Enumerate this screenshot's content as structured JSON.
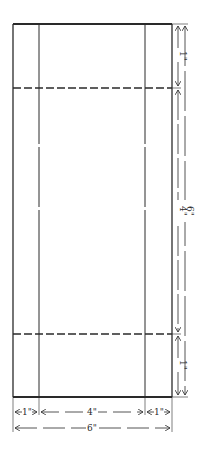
{
  "diagram": {
    "type": "dimensioned-drawing",
    "stroke_color": "#2a2a2a",
    "background": "#ffffff",
    "outline": {
      "left": 13,
      "right": 172,
      "top": 24,
      "bottom": 397
    },
    "vertical_fold_lines": [
      39,
      145
    ],
    "horizontal_dashed_lines": [
      88,
      334
    ],
    "right_dimensions": {
      "segments": [
        {
          "label": "1\"",
          "from": 24,
          "to": 88
        },
        {
          "label": "4\"",
          "from": 88,
          "to": 334
        },
        {
          "label": "1\"",
          "from": 334,
          "to": 397
        }
      ],
      "total": {
        "label": "6\"",
        "from": 24,
        "to": 397
      }
    },
    "bottom_dimensions": {
      "segments": [
        {
          "label": "1\"",
          "from": 13,
          "to": 39
        },
        {
          "label": "4\"",
          "from": 39,
          "to": 145
        },
        {
          "label": "1\"",
          "from": 145,
          "to": 172
        }
      ],
      "total": {
        "label": "6\"",
        "from": 13,
        "to": 172
      }
    }
  },
  "labels": {
    "right_top": "1\"",
    "right_middle": "4\"",
    "right_bottom": "1\"",
    "right_total": "6\"",
    "bottom_left": "1\"",
    "bottom_middle": "4\"",
    "bottom_right": "1\"",
    "bottom_total": "6\""
  }
}
